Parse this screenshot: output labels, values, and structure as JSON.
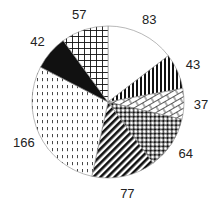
{
  "chart_data": {
    "type": "pie",
    "title": "",
    "start_angle": "12 o'clock",
    "direction": "clockwise",
    "values": [
      83,
      43,
      37,
      64,
      77,
      166,
      42,
      57
    ],
    "labels": [
      "83",
      "43",
      "37",
      "64",
      "77",
      "166",
      "42",
      "57"
    ],
    "patterns": [
      "white",
      "vertical-stripes",
      "brick",
      "checker-dots",
      "diagonal-stripes",
      "dashed-vertical",
      "solid-black",
      "grid"
    ],
    "legend": null
  },
  "colors": {
    "stroke": "#888888",
    "ink": "#111111",
    "background": "#ffffff"
  }
}
